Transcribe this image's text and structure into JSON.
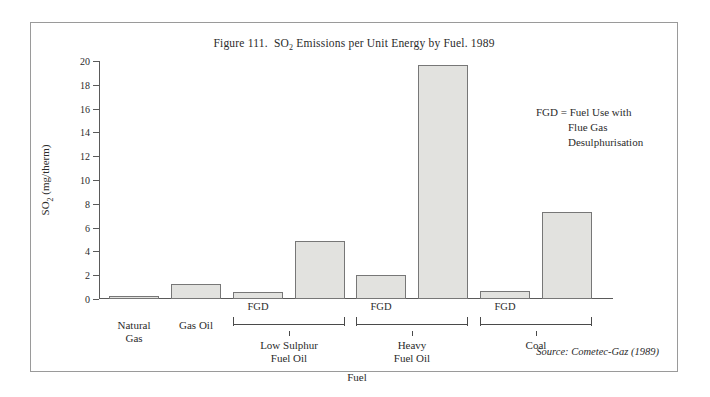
{
  "figure": {
    "title_prefix": "Figure 111.",
    "title_main": "Emissions per Unit Energy by Fuel. 1989",
    "title_full": "Figure 111.  SO2 Emissions per Unit Energy by Fuel. 1989",
    "source_note": "Source: Cometec-Gaz (1989)"
  },
  "legend": {
    "line1": "FGD = Fuel Use with",
    "line2": "Flue Gas",
    "line3": "Desulphurisation"
  },
  "axes": {
    "y_title_main": "SO",
    "y_title_sub": "2",
    "y_title_unit": "(mg/therm)",
    "y_title_full": "SO2 (mg/therm)",
    "x_title": "Fuel"
  },
  "groups": [
    {
      "label_line1": "Natural",
      "label_line2": "Gas",
      "fgd_tag": ""
    },
    {
      "label_line1": "Gas Oil",
      "label_line2": "",
      "fgd_tag": ""
    },
    {
      "label_line1": "Low Sulphur",
      "label_line2": "Fuel Oil",
      "fgd_tag": "FGD"
    },
    {
      "label_line1": "Heavy",
      "label_line2": "Fuel Oil",
      "fgd_tag": "FGD"
    },
    {
      "label_line1": "Coal",
      "label_line2": "",
      "fgd_tag": "FGD"
    }
  ],
  "chart_data": {
    "type": "bar",
    "xlabel": "Fuel",
    "ylabel": "SO2 (mg/therm)",
    "ylim": [
      0,
      20
    ],
    "yticks": [
      0,
      2,
      4,
      6,
      8,
      10,
      12,
      14,
      16,
      18,
      20
    ],
    "grid": false,
    "legend_position": "upper-right",
    "annotations": [
      "FGD = Fuel Use with Flue Gas Desulphurisation",
      "Source: Cometec-Gaz (1989)"
    ],
    "categories": [
      "Natural Gas",
      "Gas Oil",
      "Low Sulphur Fuel Oil (FGD)",
      "Low Sulphur Fuel Oil",
      "Heavy Fuel Oil (FGD)",
      "Heavy Fuel Oil",
      "Coal (FGD)",
      "Coal"
    ],
    "values": [
      0.2,
      1.3,
      0.6,
      4.9,
      2.0,
      19.7,
      0.7,
      7.3
    ],
    "bar_color": "#e2e2df",
    "bar_edge_color": "#777777"
  },
  "bars": [
    {
      "name": "natural-gas",
      "value": 0.2,
      "left": 10,
      "width": 50
    },
    {
      "name": "gas-oil",
      "value": 1.3,
      "left": 72,
      "width": 50
    },
    {
      "name": "low-sulphur-fuel-oil-fgd",
      "value": 0.6,
      "left": 134,
      "width": 50
    },
    {
      "name": "low-sulphur-fuel-oil",
      "value": 4.9,
      "left": 196,
      "width": 50
    },
    {
      "name": "heavy-fuel-oil-fgd",
      "value": 2.0,
      "left": 257,
      "width": 50
    },
    {
      "name": "heavy-fuel-oil",
      "value": 19.7,
      "left": 319,
      "width": 50
    },
    {
      "name": "coal-fgd",
      "value": 0.7,
      "left": 381,
      "width": 50
    },
    {
      "name": "coal",
      "value": 7.3,
      "left": 443,
      "width": 50
    }
  ]
}
